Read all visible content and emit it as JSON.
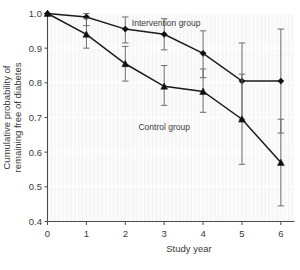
{
  "chart_data": {
    "type": "line",
    "title": "",
    "subtitle": "",
    "xlabel": "Study year",
    "ylabel": "Cumulative probability of remaining free of diabetes",
    "x": [
      0,
      1,
      2,
      3,
      4,
      5,
      6
    ],
    "xlim": [
      0,
      6.35
    ],
    "ylim": [
      0.4,
      1.0
    ],
    "xticks": [
      0,
      1,
      2,
      3,
      4,
      5,
      6
    ],
    "xtick_labels": [
      "0",
      "1",
      "2",
      "3",
      "4",
      "5",
      "6"
    ],
    "yticks": [
      0.4,
      0.5,
      0.6,
      0.7,
      0.8,
      0.9,
      1.0
    ],
    "ytick_labels": [
      "0.4",
      "0.5",
      "0.6",
      "0.7",
      "0.8",
      "0.9",
      "1.0"
    ],
    "grid": true,
    "grid_axis": "both",
    "legend_position": "inline-annotations",
    "series": [
      {
        "name": "Intervention group",
        "marker": "diamond",
        "color": "#111111",
        "label_annotation": "Intervention group",
        "values": [
          1.0,
          0.99,
          0.955,
          0.94,
          0.885,
          0.805,
          0.805
        ],
        "err_low": [
          1.0,
          0.965,
          0.915,
          0.895,
          0.815,
          0.695,
          0.655
        ],
        "err_high": [
          1.0,
          1.0,
          0.99,
          0.985,
          0.95,
          0.915,
          0.955
        ]
      },
      {
        "name": "Control group",
        "marker": "triangle",
        "color": "#111111",
        "label_annotation": "Control group",
        "values": [
          1.0,
          0.94,
          0.855,
          0.79,
          0.775,
          0.695,
          0.57
        ],
        "err_low": [
          1.0,
          0.9,
          0.805,
          0.735,
          0.715,
          0.565,
          0.445
        ],
        "err_high": [
          1.0,
          0.985,
          0.905,
          0.85,
          0.84,
          0.825,
          0.695
        ]
      }
    ],
    "annotations": [
      {
        "text": "Intervention group",
        "x": 3.05,
        "y": 0.965
      },
      {
        "text": "Control group",
        "x": 3.0,
        "y": 0.665
      }
    ]
  }
}
